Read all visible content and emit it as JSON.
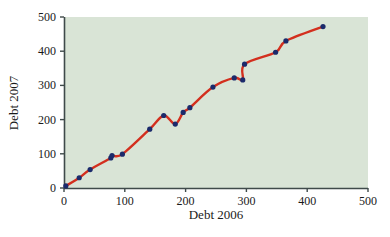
{
  "chart_data": {
    "type": "scatter",
    "title": "",
    "xlabel": "Debt 2006",
    "ylabel": "Debt 2007",
    "xlim": [
      0,
      500
    ],
    "ylim": [
      0,
      500
    ],
    "xticks": [
      0,
      100,
      200,
      300,
      400,
      500
    ],
    "yticks": [
      0,
      100,
      200,
      300,
      400,
      500
    ],
    "xtick_labels": [
      "0",
      "100",
      "200",
      "300",
      "400",
      "500"
    ],
    "ytick_labels": [
      "0",
      "100",
      "200",
      "300",
      "400",
      "500"
    ],
    "grid": false,
    "legend": null,
    "plot_background": "#d9e4d6",
    "figure_background": "#ffffff",
    "axis_color": "#3f4a4a",
    "point_color": "#1b2a6b",
    "line_color": "#d32f1e",
    "point_size": 2.6,
    "line_width": 2.4,
    "series": [
      {
        "name": "Debt 2006 vs Debt 2007",
        "marker": "filled-circle",
        "points": [
          {
            "x": 3,
            "y": 6
          },
          {
            "x": 25,
            "y": 30
          },
          {
            "x": 43,
            "y": 54
          },
          {
            "x": 77,
            "y": 88
          },
          {
            "x": 79,
            "y": 95
          },
          {
            "x": 96,
            "y": 99
          },
          {
            "x": 141,
            "y": 172
          },
          {
            "x": 164,
            "y": 212
          },
          {
            "x": 183,
            "y": 187
          },
          {
            "x": 196,
            "y": 221
          },
          {
            "x": 207,
            "y": 235
          },
          {
            "x": 245,
            "y": 295
          },
          {
            "x": 280,
            "y": 322
          },
          {
            "x": 294,
            "y": 316
          },
          {
            "x": 297,
            "y": 362
          },
          {
            "x": 348,
            "y": 397
          },
          {
            "x": 365,
            "y": 430
          },
          {
            "x": 426,
            "y": 472
          }
        ]
      }
    ],
    "fit_curve": {
      "name": "smooth-fitted-curve",
      "color": "#d32f1e",
      "description": "smooth monotone-ish spline through the scatter points with two backtracking wiggles"
    }
  },
  "axes": {
    "x_axis_label": "Debt 2006",
    "y_axis_label": "Debt 2007"
  }
}
